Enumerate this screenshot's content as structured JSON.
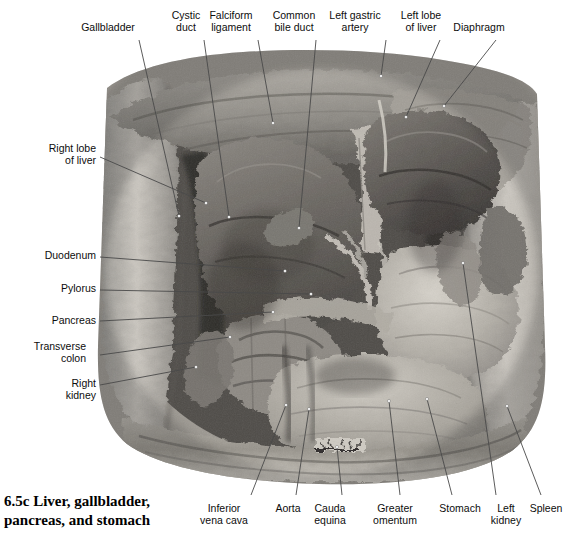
{
  "figure": {
    "caption_number": "6.5c",
    "caption_text": "6.5c  Liver, gallbladder,\npancreas, and stomach",
    "kind": "anatomical-photograph",
    "rendering": "black-and-white photograph",
    "background_color": "#ffffff",
    "label_color": "#0d0d0d",
    "leader_line_color": "#4a4a4a",
    "leader_dot_color": "#ffffff"
  },
  "labels": {
    "top": [
      {
        "id": "gallbladder",
        "text": "Gallbladder",
        "x": 108,
        "y": 22,
        "align": "center",
        "w": 66
      },
      {
        "id": "cystic-duct",
        "text": "Cystic\nduct",
        "x": 186,
        "y": 10,
        "align": "center",
        "w": 40
      },
      {
        "id": "falciform-ligament",
        "text": "Falciform\nligament",
        "x": 231,
        "y": 10,
        "align": "center",
        "w": 56
      },
      {
        "id": "common-bile-duct",
        "text": "Common\nbile duct",
        "x": 294,
        "y": 10,
        "align": "center",
        "w": 56
      },
      {
        "id": "left-gastric-artery",
        "text": "Left gastric\nartery",
        "x": 355,
        "y": 10,
        "align": "center",
        "w": 62
      },
      {
        "id": "left-lobe-of-liver",
        "text": "Left lobe\nof liver",
        "x": 421,
        "y": 10,
        "align": "center",
        "w": 52
      },
      {
        "id": "diaphragm",
        "text": "Diaphragm",
        "x": 479,
        "y": 22,
        "align": "center",
        "w": 62
      }
    ],
    "left": [
      {
        "id": "right-lobe-of-liver",
        "text": "Right lobe\nof liver",
        "x": 30,
        "y": 143,
        "align": "right",
        "w": 66
      },
      {
        "id": "duodenum",
        "text": "Duodenum",
        "x": 30,
        "y": 250,
        "align": "right",
        "w": 66
      },
      {
        "id": "pylorus",
        "text": "Pylorus",
        "x": 30,
        "y": 283,
        "align": "right",
        "w": 66
      },
      {
        "id": "pancreas",
        "text": "Pancreas",
        "x": 30,
        "y": 315,
        "align": "right",
        "w": 66
      },
      {
        "id": "transverse-colon",
        "text": "Transverse\ncolon",
        "x": 20,
        "y": 341,
        "align": "right",
        "w": 76
      },
      {
        "id": "right-kidney",
        "text": "Right\nkidney",
        "x": 30,
        "y": 378,
        "align": "right",
        "w": 66
      }
    ],
    "bottom": [
      {
        "id": "inferior-vena-cava",
        "text": "Inferior\nvena cava",
        "x": 224,
        "y": 503,
        "align": "center",
        "w": 58
      },
      {
        "id": "aorta",
        "text": "Aorta",
        "x": 288,
        "y": 503,
        "align": "center",
        "w": 36
      },
      {
        "id": "cauda-equina",
        "text": "Cauda\nequina",
        "x": 330,
        "y": 503,
        "align": "center",
        "w": 44
      },
      {
        "id": "greater-omentum",
        "text": "Greater\nomentum",
        "x": 395,
        "y": 503,
        "align": "center",
        "w": 60
      },
      {
        "id": "stomach",
        "text": "Stomach",
        "x": 460,
        "y": 503,
        "align": "center",
        "w": 50
      },
      {
        "id": "left-kidney",
        "text": "Left\nkidney",
        "x": 506,
        "y": 503,
        "align": "center",
        "w": 38
      },
      {
        "id": "spleen",
        "text": "Spleen",
        "x": 546,
        "y": 503,
        "align": "center",
        "w": 40
      }
    ]
  },
  "leader_lines": [
    {
      "id": "leader-gallbladder",
      "x1": 139,
      "y1": 40,
      "x2": 179,
      "y2": 216
    },
    {
      "id": "leader-cystic-duct",
      "x1": 204,
      "y1": 40,
      "x2": 229,
      "y2": 217
    },
    {
      "id": "leader-falciform-ligament",
      "x1": 258,
      "y1": 40,
      "x2": 273,
      "y2": 123
    },
    {
      "id": "leader-common-bile-duct",
      "x1": 316,
      "y1": 40,
      "x2": 299,
      "y2": 228
    },
    {
      "id": "leader-left-gastric-artery",
      "x1": 386,
      "y1": 40,
      "x2": 381,
      "y2": 76
    },
    {
      "id": "leader-left-lobe-of-liver",
      "x1": 440,
      "y1": 40,
      "x2": 406,
      "y2": 117
    },
    {
      "id": "leader-diaphragm",
      "x1": 496,
      "y1": 40,
      "x2": 444,
      "y2": 106
    },
    {
      "id": "leader-right-lobe-of-liver",
      "x1": 100,
      "y1": 157,
      "x2": 206,
      "y2": 203
    },
    {
      "id": "leader-duodenum",
      "x1": 100,
      "y1": 257,
      "x2": 285,
      "y2": 271
    },
    {
      "id": "leader-pylorus",
      "x1": 100,
      "y1": 290,
      "x2": 311,
      "y2": 294
    },
    {
      "id": "leader-pancreas",
      "x1": 100,
      "y1": 321,
      "x2": 273,
      "y2": 312
    },
    {
      "id": "leader-transverse-colon",
      "x1": 100,
      "y1": 355,
      "x2": 230,
      "y2": 337
    },
    {
      "id": "leader-right-kidney",
      "x1": 100,
      "y1": 385,
      "x2": 196,
      "y2": 367
    },
    {
      "id": "leader-inferior-vena-cava",
      "x1": 251,
      "y1": 495,
      "x2": 286,
      "y2": 405
    },
    {
      "id": "leader-aorta",
      "x1": 296,
      "y1": 495,
      "x2": 309,
      "y2": 409
    },
    {
      "id": "leader-cauda-equina",
      "x1": 342,
      "y1": 495,
      "x2": 337,
      "y2": 447
    },
    {
      "id": "leader-greater-omentum",
      "x1": 400,
      "y1": 495,
      "x2": 389,
      "y2": 401
    },
    {
      "id": "leader-stomach",
      "x1": 452,
      "y1": 495,
      "x2": 427,
      "y2": 399
    },
    {
      "id": "leader-left-kidney",
      "x1": 496,
      "y1": 495,
      "x2": 463,
      "y2": 263
    },
    {
      "id": "leader-spleen",
      "x1": 541,
      "y1": 495,
      "x2": 507,
      "y2": 406
    }
  ]
}
